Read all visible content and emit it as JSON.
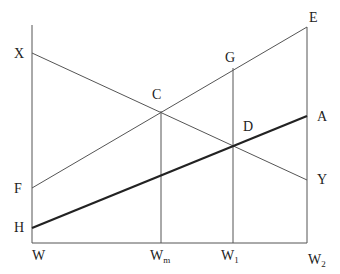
{
  "diagram": {
    "points": {
      "X": "X",
      "E": "E",
      "G": "G",
      "C": "C",
      "D": "D",
      "A": "A",
      "F": "F",
      "Y": "Y",
      "H": "H"
    },
    "axis_labels": {
      "W": "W",
      "Wm_base": "W",
      "Wm_sub": "m",
      "W1_base": "W",
      "W1_sub": "1",
      "W2_base": "W",
      "W2_sub": "2"
    },
    "lines": [
      {
        "name": "XY",
        "from": "X",
        "to": "Y",
        "style": "thin"
      },
      {
        "name": "FE",
        "from": "F",
        "to": "E",
        "style": "thin"
      },
      {
        "name": "HA",
        "from": "H",
        "to": "A",
        "style": "thick"
      },
      {
        "name": "Wm-C",
        "from": "Wm",
        "to": "C",
        "style": "thin"
      },
      {
        "name": "W1-G",
        "from": "W1",
        "to": "G",
        "style": "thin"
      }
    ],
    "colors": {
      "line": "#555555",
      "thick_line": "#222222",
      "text": "#222222"
    }
  }
}
